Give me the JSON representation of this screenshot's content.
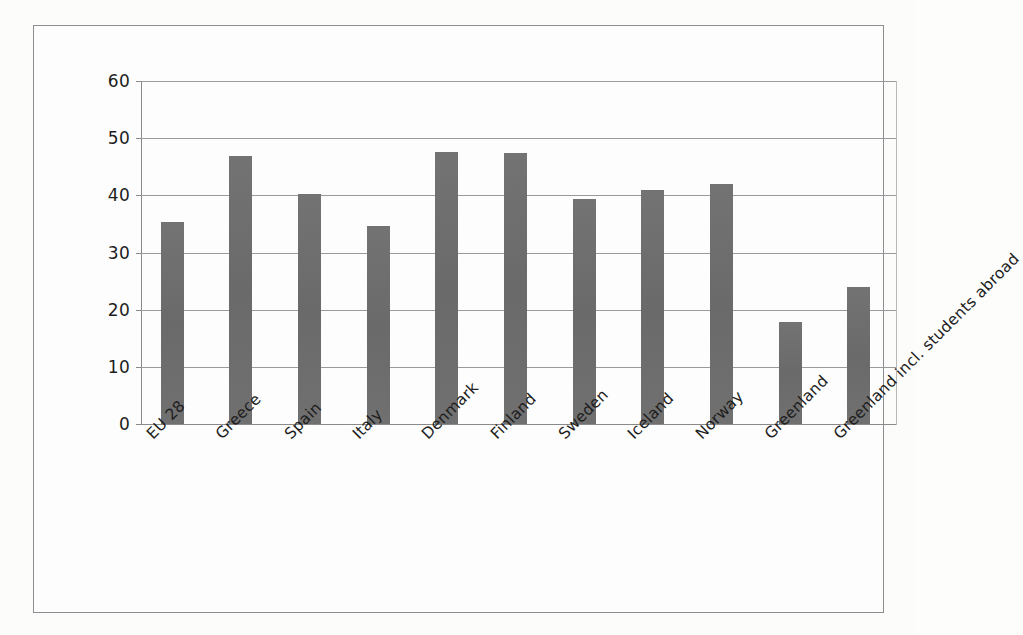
{
  "chart_data": {
    "type": "bar",
    "title": "",
    "subtitle": "",
    "xlabel": "",
    "ylabel": "",
    "ylim": [
      0,
      60
    ],
    "ytick_step": 10,
    "yticks": [
      60,
      50,
      40,
      30,
      20,
      10,
      0
    ],
    "grid": true,
    "legend": false,
    "legend_position": "none",
    "orientation": "vertical",
    "categories": [
      "EU 28",
      "Greece",
      "Spain",
      "Italy",
      "Denmark",
      "Finland",
      "Sweden",
      "Iceland",
      "Norway",
      "Greenland",
      "Greenland incl. students abroad"
    ],
    "values": [
      35.3,
      46.9,
      40.3,
      34.7,
      47.6,
      47.4,
      39.4,
      41.0,
      41.9,
      17.9,
      23.9
    ],
    "series": [
      {
        "name": "",
        "values": [
          35.3,
          46.9,
          40.3,
          34.7,
          47.6,
          47.4,
          39.4,
          41.0,
          41.9,
          17.9,
          23.9
        ]
      }
    ],
    "annotations": []
  },
  "style": {
    "bar_color": "#6e6e6e",
    "gridline_color": "#9a9a9a",
    "axis_color": "#8a8a8a",
    "frame_color": "#8d8d8d",
    "text_color": "#1d1d1d",
    "background_color": "#fdfdfd"
  }
}
